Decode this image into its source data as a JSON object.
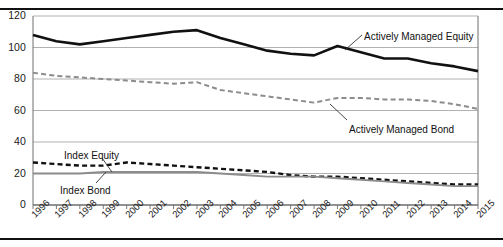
{
  "chart_data": {
    "type": "line",
    "title": "",
    "xlabel": "",
    "ylabel": "",
    "ylim": [
      0,
      120
    ],
    "yticks": [
      0,
      20,
      40,
      60,
      80,
      100,
      120
    ],
    "grid": true,
    "legend_position": "inline-annotations",
    "categories": [
      "1996",
      "1997",
      "1998",
      "1999",
      "2000",
      "2001",
      "2002",
      "2003",
      "2004",
      "2005",
      "2006",
      "2007",
      "2008",
      "2009",
      "2010",
      "2011",
      "2012",
      "2013",
      "2014",
      "2015"
    ],
    "series": [
      {
        "name": "Actively Managed Equity",
        "style": "solid-black-thick",
        "color": "#111111",
        "values": [
          108,
          104,
          102,
          104,
          106,
          108,
          110,
          111,
          106,
          102,
          98,
          96,
          95,
          101,
          97,
          93,
          93,
          90,
          88,
          85
        ]
      },
      {
        "name": "Actively Managed Bond",
        "style": "dashed-gray",
        "color": "#8c8c8c",
        "values": [
          84,
          82,
          81,
          80,
          79,
          78,
          77,
          78,
          73,
          71,
          69,
          67,
          65,
          68,
          68,
          67,
          67,
          66,
          64,
          61
        ]
      },
      {
        "name": "Index Equity",
        "style": "dashed-black",
        "color": "#111111",
        "values": [
          27,
          26,
          25,
          25,
          27,
          26,
          25,
          24,
          23,
          22,
          21,
          19,
          18,
          18,
          17,
          16,
          15,
          14,
          13,
          13
        ]
      },
      {
        "name": "Index Bond",
        "style": "solid-gray",
        "color": "#8c8c8c",
        "values": [
          20,
          20,
          20,
          21,
          21,
          21,
          21,
          21,
          20,
          19,
          18,
          18,
          18,
          17,
          16,
          15,
          14,
          13,
          12,
          12
        ]
      }
    ],
    "annotations": [
      {
        "label": "Actively Managed Equity",
        "x": 364,
        "y": 31
      },
      {
        "label": "Actively Managed Bond",
        "x": 349,
        "y": 124
      },
      {
        "label": "Index Equity",
        "x": 64,
        "y": 150
      },
      {
        "label": "Index Bond",
        "x": 60,
        "y": 185
      }
    ]
  }
}
